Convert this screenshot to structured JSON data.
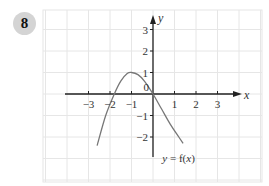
{
  "question": {
    "number": "8"
  },
  "chart_data": {
    "type": "line",
    "title": "",
    "xlabel": "x",
    "ylabel": "y",
    "xlim": [
      -4.2,
      5
    ],
    "ylim": [
      -4,
      4
    ],
    "x_ticks": [
      -3,
      -2,
      -1,
      1,
      2,
      3
    ],
    "y_ticks": [
      3,
      2,
      1,
      -1,
      -2
    ],
    "x_tick_labels": [
      "−3",
      "−2",
      "−1",
      "1",
      "2",
      "3"
    ],
    "y_tick_labels": [
      "3",
      "2",
      "1",
      "−1",
      "−2"
    ],
    "origin_label": "0",
    "grid": true,
    "legend": null,
    "series": [
      {
        "name": "y = f(x)",
        "x": [
          -2.6,
          -2.2,
          -1.8,
          -1.5,
          -1.2,
          -1.0,
          -0.7,
          -0.4,
          0.0,
          0.4,
          0.8,
          1.2,
          1.4
        ],
        "y": [
          -2.4,
          -1.0,
          0.0,
          0.6,
          0.95,
          1.0,
          0.9,
          0.6,
          0.0,
          -0.7,
          -1.4,
          -2.0,
          -2.3
        ]
      }
    ],
    "annotations": [
      {
        "text": "y = f(x)",
        "x": 0.9,
        "y": -2.9
      }
    ]
  },
  "colors": {
    "grid": "#e6e6e6",
    "axis": "#222222",
    "curve": "#777777",
    "badge": "#d4d4d4"
  }
}
